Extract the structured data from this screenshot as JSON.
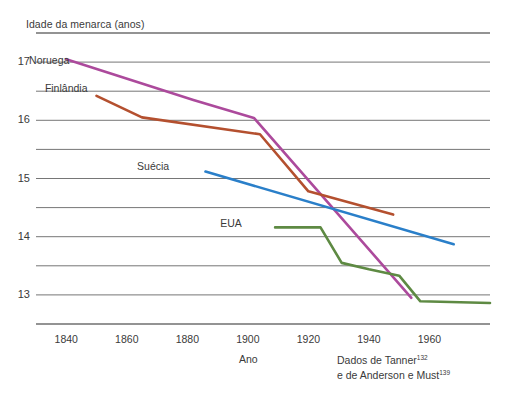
{
  "chart_data": {
    "type": "line",
    "title": "Idade da menarca (anos)",
    "xlabel": "Ano",
    "ylabel": "Idade da menarca (anos)",
    "xlim": [
      1830,
      1980
    ],
    "ylim": [
      12.5,
      17.5
    ],
    "grid": true,
    "grid_values": [
      17.5,
      17.0,
      16.5,
      16.0,
      15.5,
      15.0,
      14.5,
      14.0,
      13.5,
      13.0,
      12.5
    ],
    "legend_position": "inline-labels",
    "x_ticks": [
      "1840",
      "1860",
      "1880",
      "1900",
      "1920",
      "1940",
      "1960"
    ],
    "x_tick_values": [
      1840,
      1860,
      1880,
      1900,
      1920,
      1940,
      1960
    ],
    "y_ticks": [
      "17",
      "16",
      "15",
      "14",
      "13"
    ],
    "y_tick_values": [
      17,
      16,
      15,
      14,
      13
    ],
    "series": [
      {
        "name": "Noruega",
        "color": "#ac4a9c",
        "label_x": 1843,
        "label_y": 17.02,
        "x": [
          1840,
          1882,
          1902,
          1954
        ],
        "y": [
          17.05,
          16.35,
          16.04,
          12.95
        ]
      },
      {
        "name": "Finlândia",
        "color": "#b4502f",
        "label_x": 1849,
        "label_y": 16.53,
        "x": [
          1850,
          1865,
          1904,
          1920,
          1948
        ],
        "y": [
          16.42,
          16.05,
          15.76,
          14.78,
          14.38
        ]
      },
      {
        "name": "Suécia",
        "color": "#2a7fc9",
        "label_x": 1876,
        "label_y": 15.2,
        "x": [
          1886,
          1968
        ],
        "y": [
          15.12,
          13.87
        ]
      },
      {
        "name": "EUA",
        "color": "#5e8a43",
        "label_x": 1900,
        "label_y": 14.22,
        "x": [
          1909,
          1924,
          1931,
          1940,
          1950,
          1957,
          1980
        ],
        "y": [
          14.16,
          14.16,
          13.55,
          13.44,
          13.33,
          12.89,
          12.86
        ]
      }
    ],
    "source_note_line1": "Dados de Tanner",
    "source_note_ref1": "132",
    "source_note_line2": "e de Anderson e Must",
    "source_note_ref2": "139",
    "colors": {
      "grid": "#6f6f6f",
      "axis": "#3b3b3b",
      "text": "#3a3a3a",
      "background": "#ffffff"
    }
  }
}
